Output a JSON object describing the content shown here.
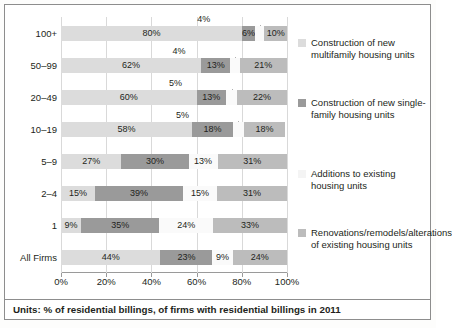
{
  "footer": {
    "text": "Units: % of residential billings, of firms with residential billings in 2011"
  },
  "legend": {
    "items": [
      {
        "label": "Construction of new multifamily housing units",
        "color": "#dcdcdc"
      },
      {
        "label": "Construction of new single-family housing units",
        "color": "#9a9a9a"
      },
      {
        "label": "Additions to existing housing units",
        "color": "#f4f4f4"
      },
      {
        "label": "Renovations/remodels/alterations of existing housing units",
        "color": "#bcbcbc"
      }
    ]
  },
  "chart_data": {
    "type": "bar",
    "orientation": "horizontal",
    "stacked": true,
    "title": "",
    "xlabel": "",
    "ylabel": "",
    "xlim": [
      0,
      100
    ],
    "xticks": [
      "0%",
      "20%",
      "40%",
      "60%",
      "80%",
      "100%"
    ],
    "xtick_values": [
      0,
      20,
      40,
      60,
      80,
      100
    ],
    "grid": true,
    "legend_position": "right",
    "categories": [
      "100+",
      "50–99",
      "20–49",
      "10–19",
      "5–9",
      "2–4",
      "1",
      "All Firms"
    ],
    "series": [
      {
        "name": "Construction of new multifamily housing units",
        "color": "#dcdcdc",
        "values": [
          80,
          62,
          60,
          58,
          27,
          15,
          9,
          44
        ]
      },
      {
        "name": "Construction of new single-family housing units",
        "color": "#9a9a9a",
        "values": [
          6,
          13,
          13,
          18,
          30,
          39,
          35,
          23
        ]
      },
      {
        "name": "Additions to existing housing units",
        "color": "#f4f4f4",
        "values": [
          4,
          4,
          5,
          5,
          13,
          15,
          24,
          9
        ]
      },
      {
        "name": "Renovations/remodels/alterations of existing housing units",
        "color": "#bcbcbc",
        "values": [
          10,
          21,
          22,
          18,
          31,
          31,
          33,
          24
        ]
      }
    ],
    "data_labels": [
      [
        "80%",
        "6%",
        "4%",
        "10%"
      ],
      [
        "62%",
        "13%",
        "4%",
        "21%"
      ],
      [
        "60%",
        "13%",
        "5%",
        "22%"
      ],
      [
        "58%",
        "18%",
        "5%",
        "18%"
      ],
      [
        "27%",
        "30%",
        "13%",
        "31%"
      ],
      [
        "15%",
        "39%",
        "15%",
        "31%"
      ],
      [
        "9%",
        "35%",
        "24%",
        "33%"
      ],
      [
        "44%",
        "23%",
        "9%",
        "24%"
      ]
    ],
    "callout_series_index": 2,
    "callout_rows": [
      0,
      1,
      2,
      3
    ]
  }
}
